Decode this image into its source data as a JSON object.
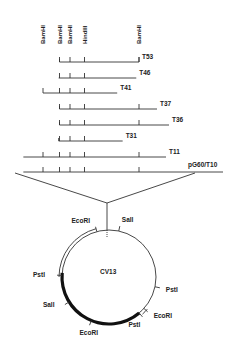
{
  "site_labels": [
    {
      "name": "BamHI",
      "pos": 0
    },
    {
      "name": "BamHI",
      "pos": 1
    },
    {
      "name": "BamHI",
      "pos": 2
    },
    {
      "name": "HindIII",
      "pos": 3
    },
    {
      "name": "BamHI",
      "pos": 4
    }
  ],
  "clones": [
    {
      "label": "T53",
      "start": 1,
      "end": 4,
      "sites": [
        1,
        2,
        3,
        4
      ],
      "end_tick": true,
      "start_tick": true
    },
    {
      "label": "T46",
      "start": 0.95,
      "end": 3.95,
      "sites": [
        1,
        2,
        3
      ],
      "end_tick": false,
      "start_tick": false
    },
    {
      "label": "T41",
      "start": 0.0,
      "end": 3.6,
      "sites": [
        0,
        1,
        2,
        3
      ],
      "end_tick": false,
      "start_tick": false
    },
    {
      "label": "T37",
      "start": 1,
      "end": 4.3,
      "sites": [
        1,
        2,
        3,
        4
      ],
      "end_tick": false,
      "start_tick": true
    },
    {
      "label": "T36",
      "start": 1,
      "end": 4.5,
      "sites": [
        1,
        2,
        3,
        4
      ],
      "end_tick": false,
      "start_tick": true
    },
    {
      "label": "T31",
      "start": 0.95,
      "end": 3.7,
      "sites": [
        1,
        2,
        3
      ],
      "end_tick": false,
      "start_tick": true
    },
    {
      "label": "T11",
      "start": -0.7,
      "end": 4.45,
      "sites": [
        0,
        1,
        2,
        3,
        4
      ],
      "end_tick": false,
      "start_tick": false
    },
    {
      "label": "pG60/T10",
      "start": -0.7,
      "end": 5.4,
      "sites": [
        0,
        1,
        2,
        3,
        4
      ],
      "end_tick": false,
      "start_tick": false,
      "is_vector": true
    }
  ],
  "plasmid": {
    "name": "CV13",
    "sites": [
      {
        "name": "EcoRI",
        "angle": -105
      },
      {
        "name": "SalI",
        "angle": -78
      },
      {
        "name": "PstI",
        "angle": 182
      },
      {
        "name": "SalI",
        "angle": 148
      },
      {
        "name": "EcoRI",
        "angle": 112
      },
      {
        "name": "PstI",
        "angle": 50
      },
      {
        "name": "EcoRI",
        "angle": 42
      },
      {
        "name": "PstI",
        "angle": 12
      }
    ],
    "double_arcs": [
      [
        -105,
        -180
      ],
      [
        40,
        48
      ]
    ],
    "thick_arc": [
      185,
      50
    ]
  }
}
